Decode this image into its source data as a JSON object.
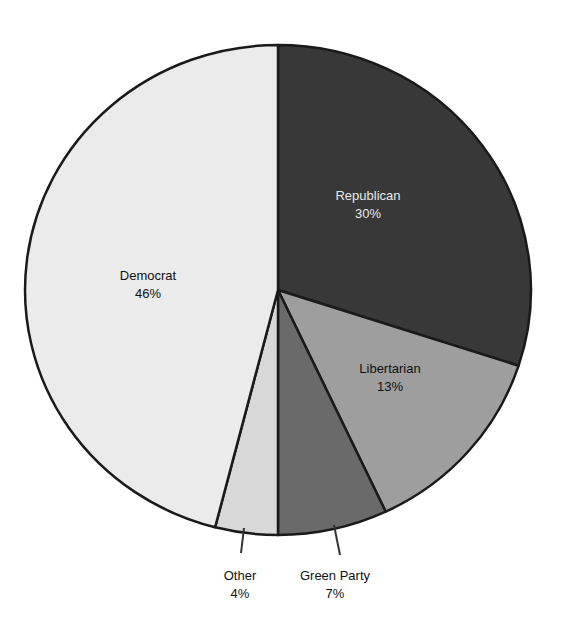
{
  "chart_data": {
    "type": "pie",
    "title": "",
    "start_angle_deg": 0,
    "direction": "clockwise",
    "slices": [
      {
        "label": "Republican",
        "value": 30,
        "display": "30%",
        "color": "#383838",
        "text_color": "#e8e8e8",
        "label_pos": [
          368,
          200
        ]
      },
      {
        "label": "Libertarian",
        "value": 13,
        "display": "13%",
        "color": "#9e9e9e",
        "text_color": "#111111",
        "label_pos": [
          390,
          373
        ]
      },
      {
        "label": "Green Party",
        "value": 7,
        "display": "7%",
        "color": "#6a6a6a",
        "text_color": "#111111",
        "label_pos": [
          335,
          580
        ],
        "leader": [
          [
            334,
            525
          ],
          [
            340,
            555
          ]
        ]
      },
      {
        "label": "Other",
        "value": 4,
        "display": "4%",
        "color": "#d8d8d8",
        "text_color": "#111111",
        "label_pos": [
          240,
          580
        ],
        "leader": [
          [
            244,
            528
          ],
          [
            241,
            553
          ]
        ]
      },
      {
        "label": "Democrat",
        "value": 46,
        "display": "46%",
        "color": "#ebebeb",
        "text_color": "#111111",
        "label_pos": [
          148,
          280
        ]
      }
    ],
    "legend": "none",
    "value_format": "percent"
  }
}
